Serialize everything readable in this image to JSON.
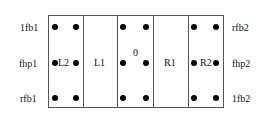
{
  "left_labels": [
    "1fb1",
    "fhp1",
    "rfb1"
  ],
  "right_labels": [
    "rfb2",
    "fhp2",
    "1fb2"
  ],
  "columns": [
    "L2",
    "L1",
    "0",
    "R1",
    "R2"
  ]
}
